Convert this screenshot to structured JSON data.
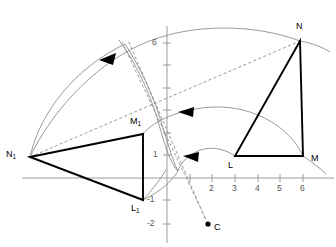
{
  "figure": {
    "type": "geometry-diagram",
    "background": "#ffffff",
    "stroke_dark": "#000000",
    "stroke_light": "#8d8d8d",
    "axis_color": "#9a9a9a"
  },
  "axes": {
    "x_ticks": [
      "2",
      "3",
      "4",
      "5",
      "6"
    ],
    "y_ticks": [
      "6",
      "1",
      "-1",
      "-2"
    ],
    "origin_px": {
      "x": 167,
      "y": 178
    },
    "unit_px": 22.6,
    "x_axis_label": "",
    "y_axis_label": "",
    "grid": false
  },
  "points": [
    {
      "name": "N",
      "label": "N",
      "coord": [
        5,
        6
      ],
      "px": [
        300,
        41
      ],
      "label_px": [
        296,
        27
      ]
    },
    {
      "name": "M",
      "label": "M",
      "coord": [
        6,
        1
      ],
      "px": [
        303,
        156
      ],
      "label_px": [
        311,
        158
      ]
    },
    {
      "name": "L",
      "label": "L",
      "coord": [
        3,
        1
      ],
      "px": [
        235,
        156
      ],
      "label_px": [
        229,
        164
      ]
    },
    {
      "name": "N1",
      "label": "N",
      "sub": "1",
      "coord": [
        -6.1,
        0.9
      ],
      "px": [
        30,
        157
      ],
      "label_px": [
        8,
        152
      ]
    },
    {
      "name": "M1",
      "label": "M",
      "sub": "1",
      "coord": [
        -1.1,
        1.95
      ],
      "px": [
        143,
        134
      ],
      "label_px": [
        131,
        120
      ]
    },
    {
      "name": "L1",
      "label": "L",
      "sub": "1",
      "coord": [
        -1.1,
        -0.98
      ],
      "px": [
        143,
        200
      ],
      "label_px": [
        132,
        206
      ]
    },
    {
      "name": "C",
      "label": "C",
      "coord": [
        1.0,
        -2.05
      ],
      "px": [
        208,
        224
      ],
      "label_px": [
        214,
        226
      ]
    }
  ],
  "triangles": [
    {
      "name": "triangle-LMN",
      "vertices": [
        "L",
        "M",
        "N"
      ]
    },
    {
      "name": "triangle-L1M1N1",
      "vertices": [
        "L1",
        "M1",
        "N1"
      ]
    }
  ],
  "rotation_arcs": [
    {
      "name": "arc-N-to-N1",
      "from": "N",
      "to": "N1",
      "arrow": "left"
    },
    {
      "name": "arc-M-to-M1",
      "from": "M",
      "to": "M1",
      "arrow": "left"
    },
    {
      "name": "arc-L-to-L1",
      "from": "L",
      "to": "L1",
      "arrow": "left"
    }
  ],
  "dashed_lines": [
    {
      "name": "chord-N1-to-N"
    },
    {
      "name": "ray-C-through-upper-intersection"
    },
    {
      "name": "ray-C-downward"
    }
  ]
}
